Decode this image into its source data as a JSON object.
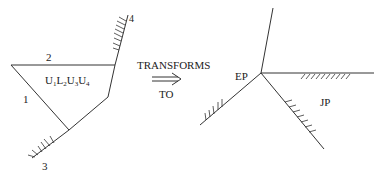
{
  "left_figure": {
    "region_label": "U",
    "region_subscripts": [
      "1",
      "2",
      "3",
      "4"
    ],
    "region_letters": [
      "U",
      "L",
      "U",
      "U"
    ],
    "edge_labels": {
      "top": "2",
      "left": "1",
      "bottom": "3",
      "right": "4"
    }
  },
  "transform": {
    "top_text": "TRANSFORMS",
    "bottom_text": "TO",
    "arrow": "⟹"
  },
  "right_figure": {
    "vertex_label": "EP",
    "region_label": "JP"
  },
  "colors": {
    "line": "#333333",
    "text": "#222222",
    "background": "#ffffff"
  }
}
